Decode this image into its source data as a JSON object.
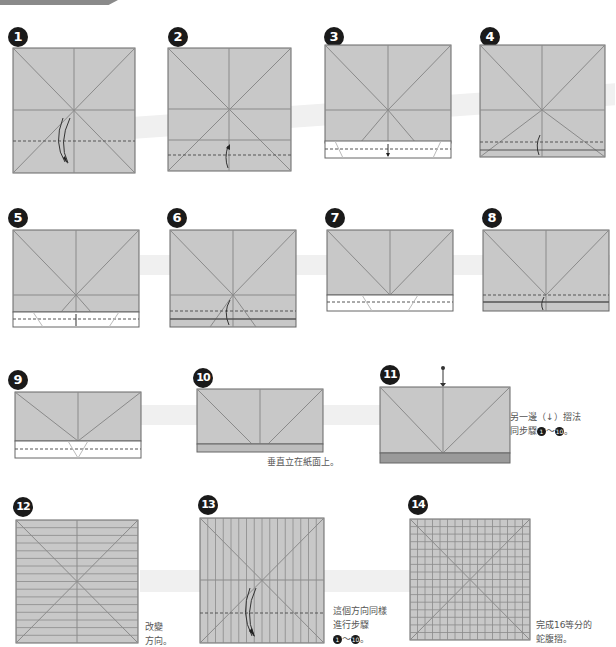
{
  "colors": {
    "paper": "#c8c8c8",
    "paper_edge": "#666666",
    "crease": "#8a8a8a",
    "white_flap": "#ffffff",
    "badge": "#1a1a1a",
    "stripe": "#f0f0f0"
  },
  "steps": [
    {
      "number": "1"
    },
    {
      "number": "2"
    },
    {
      "number": "3"
    },
    {
      "number": "4"
    },
    {
      "number": "5"
    },
    {
      "number": "6"
    },
    {
      "number": "7"
    },
    {
      "number": "8"
    },
    {
      "number": "9"
    },
    {
      "number": "10",
      "note": "垂直立在紙面上。"
    },
    {
      "number": "11",
      "note_line1_a": "另一邊（",
      "note_line1_b": "）摺法",
      "note_line2": "同步驟",
      "note_range_start": "1",
      "note_tilde": "～",
      "note_range_end": "10",
      "note_end": "。"
    },
    {
      "number": "12",
      "note_line1": "改變",
      "note_line2": "方向。"
    },
    {
      "number": "13",
      "note_line1": "這個方向同樣",
      "note_line2": "進行步驟",
      "note_range_start": "1",
      "note_tilde": "～",
      "note_range_end": "10",
      "note_end": "。"
    },
    {
      "number": "14",
      "note_line1": "完成16等分的",
      "note_line2": "蛇腹摺。"
    }
  ]
}
